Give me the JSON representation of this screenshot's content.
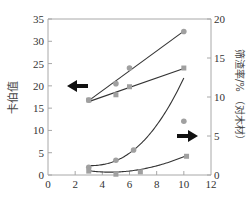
{
  "chart_data": {
    "type": "line",
    "title": "",
    "xlabel": "",
    "ylabel_left": "卡伯值",
    "ylabel_right": "筛渣率/% （对木材）",
    "xlim": [
      0,
      12
    ],
    "ylim_left": [
      0,
      35
    ],
    "ylim_right": [
      0,
      20
    ],
    "x_ticks": [
      "0",
      "2",
      "4",
      "6",
      "8",
      "10",
      "12"
    ],
    "y_ticks_left": [
      "0",
      "5",
      "10",
      "15",
      "20",
      "25",
      "30",
      "35"
    ],
    "y_ticks_right": [
      "0",
      "5",
      "10",
      "15",
      "20"
    ],
    "grid": false,
    "legend": null,
    "series": [
      {
        "name": "卡伯值 (circles, upper line)",
        "axis": "left",
        "marker": "circle",
        "fit": "linear",
        "x": [
          3,
          5,
          6,
          10
        ],
        "values": [
          16.8,
          20.5,
          24,
          32.2
        ]
      },
      {
        "name": "卡伯值 (squares, lower line)",
        "axis": "left",
        "marker": "square",
        "fit": "linear",
        "x": [
          3,
          5,
          6,
          10
        ],
        "values": [
          16.8,
          18,
          19.8,
          24
        ]
      },
      {
        "name": "筛渣率 (circles, upper curve)",
        "axis": "right",
        "marker": "circle",
        "fit": "curve",
        "x": [
          3,
          5,
          6.3,
          10
        ],
        "values": [
          1.0,
          1.9,
          3.2,
          6.9
        ]
      },
      {
        "name": "筛渣率 (squares, lower curve)",
        "axis": "right",
        "marker": "square",
        "fit": "curve",
        "x": [
          3,
          5,
          6.8,
          10.2
        ],
        "values": [
          0.5,
          0.1,
          0.4,
          2.4
        ]
      }
    ],
    "annotations": [
      {
        "type": "arrow",
        "direction": "left",
        "meaning": "upper curves read on left axis",
        "near": {
          "x": 3,
          "y_left": 20
        }
      },
      {
        "type": "arrow",
        "direction": "right",
        "meaning": "lower curves read on right axis",
        "near": {
          "x": 10.5,
          "y_right": 5
        }
      }
    ]
  },
  "colors": {
    "marker": "#a0a0a0",
    "line": "#333333",
    "axis": "#a8a8a8",
    "text": "#333333",
    "arrow": "#111111"
  }
}
